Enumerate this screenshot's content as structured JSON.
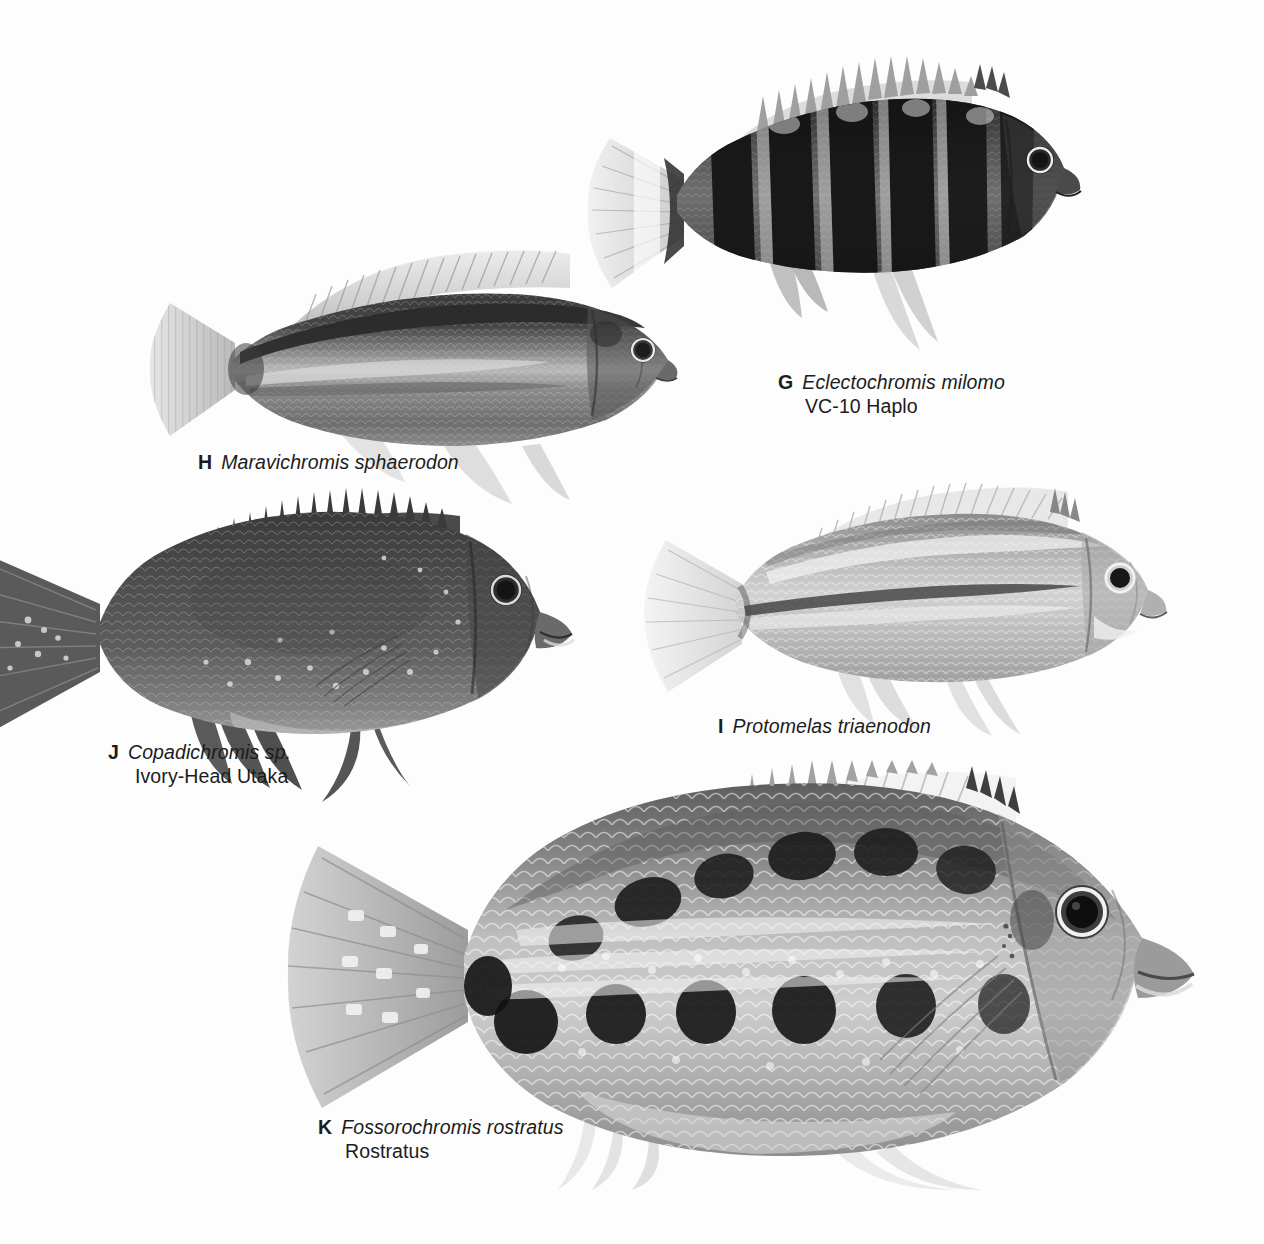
{
  "plate": {
    "background_color": "#fdfdfd",
    "text_color": "#1c1c1c",
    "width": 1264,
    "height": 1244,
    "kind": "field-guide-photo-plate"
  },
  "specimens": [
    {
      "letter": "G",
      "scientific_name": "Eclectochromis milomo",
      "common_name": "VC-10 Haplo",
      "caption_x": 778,
      "caption_y": 370,
      "description": "dark cichlid with six broad black vertical bars, spiny dorsal fin, pale caudal fin with dark bar"
    },
    {
      "letter": "H",
      "scientific_name": "Maravichromis sphaerodon",
      "common_name": "",
      "caption_x": 198,
      "caption_y": 450,
      "description": "elongate cichlid with bold dark dorsal-lateral stripe and pale mid-body band"
    },
    {
      "letter": "I",
      "scientific_name": "Protomelas triaenodon",
      "common_name": "",
      "caption_x": 718,
      "caption_y": 714,
      "description": "pale silvery cichlid with thin dark lateral line and light scale rows"
    },
    {
      "letter": "J",
      "scientific_name": "Copadichromis sp.",
      "common_name": "Ivory-Head Utaka",
      "caption_x": 108,
      "caption_y": 740,
      "description": "uniformly dark deep-bodied cichlid with pale speckles, tail cropped at left page edge"
    },
    {
      "letter": "K",
      "scientific_name": "Fossorochromis rostratus",
      "common_name": "Rostratus",
      "caption_x": 318,
      "caption_y": 1115,
      "description": "large deep-bodied cichlid with two rows of dark blotches and bright scale rows"
    }
  ]
}
